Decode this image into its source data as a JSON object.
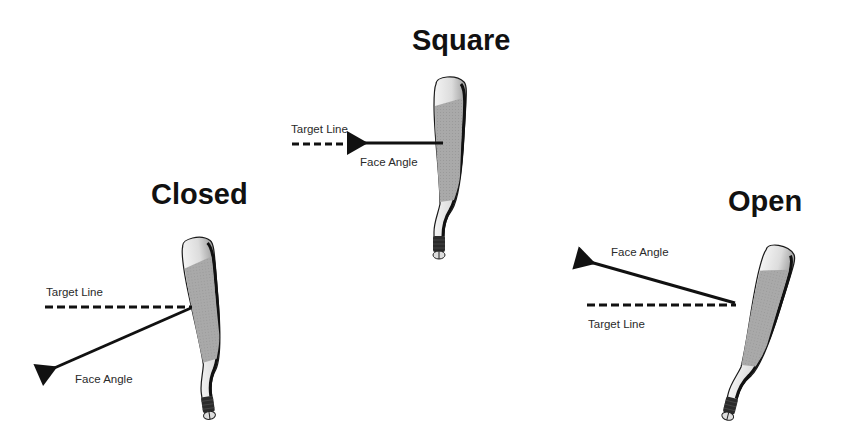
{
  "diagram": {
    "panels": [
      {
        "id": "square",
        "title": "Square",
        "target_line_label": "Target Line",
        "face_angle_label": "Face Angle",
        "face_angle_relation": "aligned with target line"
      },
      {
        "id": "closed",
        "title": "Closed",
        "target_line_label": "Target Line",
        "face_angle_label": "Face Angle",
        "face_angle_relation": "points below/left of target line"
      },
      {
        "id": "open",
        "title": "Open",
        "target_line_label": "Target Line",
        "face_angle_label": "Face Angle",
        "face_angle_relation": "points above/right of target line"
      }
    ],
    "colors": {
      "background": "#ffffff",
      "text": "#111111",
      "line": "#111111",
      "club_face": "#a8a8a8",
      "club_chrome": "#e6e6e6",
      "club_outline": "#1a1a1a",
      "ferrule": "#2b2b2b"
    }
  }
}
